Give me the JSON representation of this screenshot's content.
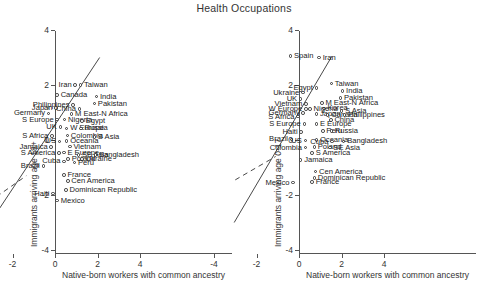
{
  "figure": {
    "title": "Health Occupations",
    "xlabel": "Native-born workers with common ancestry",
    "xticks": [
      "-4",
      "-2",
      "0",
      "2",
      "4"
    ],
    "yticks": [
      "4",
      "2",
      "0",
      "-2",
      "-4"
    ]
  },
  "chart_data": {
    "type": "scatter",
    "title": "Health Occupations",
    "xlabel": "Native-born workers with common ancestry",
    "xlim": [
      -5,
      5
    ],
    "ylim": [
      -5,
      5
    ],
    "grid": false,
    "legend": null,
    "panels": [
      {
        "name": "left",
        "ylabel": "Immigrants arriving age 18+",
        "fit_line_solid": {
          "x": [
            -3.05,
            2.1
          ],
          "y": [
            -3.0,
            3.0
          ]
        },
        "fit_line_dashed": {
          "x": [
            -3.1,
            -1.35
          ],
          "y": [
            -2.25,
            -1.3
          ]
        },
        "points": [
          {
            "label": "Iran",
            "x": 0.95,
            "y": 2.0,
            "side": "r"
          },
          {
            "label": "Taiwan",
            "x": 1.2,
            "y": 2.0,
            "side": "l"
          },
          {
            "label": "Canada",
            "x": 0.1,
            "y": 1.63,
            "side": "l"
          },
          {
            "label": "India",
            "x": 1.95,
            "y": 1.58,
            "side": "l"
          },
          {
            "label": "Pakistan",
            "x": 1.85,
            "y": 1.32,
            "side": "l"
          },
          {
            "label": "Philippines",
            "x": 0.85,
            "y": 1.27,
            "side": "r"
          },
          {
            "label": "Japan",
            "x": 0.05,
            "y": 1.16,
            "side": "r"
          },
          {
            "label": "China",
            "x": 1.15,
            "y": 1.12,
            "side": "r"
          },
          {
            "label": "Germany",
            "x": -0.3,
            "y": 0.97,
            "side": "r"
          },
          {
            "label": "M East-N Africa",
            "x": 0.78,
            "y": 0.95,
            "side": "l"
          },
          {
            "label": "S Europe",
            "x": 0.1,
            "y": 0.74,
            "side": "r"
          },
          {
            "label": "Nigeria",
            "x": 0.45,
            "y": 0.74,
            "side": "l"
          },
          {
            "label": "Egypt",
            "x": 1.28,
            "y": 0.7,
            "side": "l"
          },
          {
            "label": "UK",
            "x": 0.25,
            "y": 0.47,
            "side": "r"
          },
          {
            "label": "W Europe",
            "x": 0.55,
            "y": 0.42,
            "side": "l"
          },
          {
            "label": "Russia",
            "x": 1.22,
            "y": 0.42,
            "side": "l"
          },
          {
            "label": "S Africa",
            "x": -0.15,
            "y": 0.15,
            "side": "r"
          },
          {
            "label": "Colombia",
            "x": 0.58,
            "y": 0.16,
            "side": "l"
          },
          {
            "label": "S Asia",
            "x": 1.85,
            "y": 0.1,
            "side": "l"
          },
          {
            "label": "US",
            "x": 0.22,
            "y": -0.05,
            "side": "r"
          },
          {
            "label": "Oceania",
            "x": 0.55,
            "y": -0.03,
            "side": "l"
          },
          {
            "label": "Jamaica",
            "x": -0.18,
            "y": -0.26,
            "side": "r"
          },
          {
            "label": "Vietnam",
            "x": 0.7,
            "y": -0.24,
            "side": "l"
          },
          {
            "label": "S America",
            "x": 0.18,
            "y": -0.48,
            "side": "r"
          },
          {
            "label": "E Europe",
            "x": 0.42,
            "y": -0.46,
            "side": "l"
          },
          {
            "label": "SE Asia",
            "x": 1.1,
            "y": -0.55,
            "side": "l"
          },
          {
            "label": "Bangladesh",
            "x": 1.9,
            "y": -0.55,
            "side": "l"
          },
          {
            "label": "Poland",
            "x": 0.62,
            "y": -0.7,
            "side": "l"
          },
          {
            "label": "Ukraine",
            "x": 1.28,
            "y": -0.7,
            "side": "l"
          },
          {
            "label": "Cuba",
            "x": 0.42,
            "y": -0.78,
            "side": "r"
          },
          {
            "label": "Peru",
            "x": 0.92,
            "y": -0.82,
            "side": "l"
          },
          {
            "label": "Brazil",
            "x": -0.55,
            "y": -0.95,
            "side": "r"
          },
          {
            "label": "France",
            "x": 0.42,
            "y": -1.28,
            "side": "l"
          },
          {
            "label": "Cen America",
            "x": 0.6,
            "y": -1.5,
            "side": "l"
          },
          {
            "label": "Dominican Republic",
            "x": 0.52,
            "y": -1.82,
            "side": "l"
          },
          {
            "label": "Haiti",
            "x": -0.1,
            "y": -1.95,
            "side": "r"
          },
          {
            "label": "Mexico",
            "x": 0.1,
            "y": -2.2,
            "side": "l"
          }
        ]
      },
      {
        "name": "right",
        "ylabel": "Immigrants arriving age 0-17",
        "fit_line_solid": {
          "x": [
            -3.05,
            1.55
          ],
          "y": [
            -3.0,
            3.05
          ]
        },
        "fit_line_dashed": {
          "x": [
            -3.0,
            -1.1
          ],
          "y": [
            -1.45,
            -0.6
          ]
        },
        "points": [
          {
            "label": "Spain",
            "x": -0.4,
            "y": 3.05,
            "side": "l"
          },
          {
            "label": "Iran",
            "x": 0.95,
            "y": 3.0,
            "side": "l"
          },
          {
            "label": "Taiwan",
            "x": 1.52,
            "y": 2.05,
            "side": "l"
          },
          {
            "label": "Egypt",
            "x": 0.82,
            "y": 1.9,
            "side": "r"
          },
          {
            "label": "India",
            "x": 2.05,
            "y": 1.78,
            "side": "l"
          },
          {
            "label": "Ukraine",
            "x": 0.18,
            "y": 1.72,
            "side": "r"
          },
          {
            "label": "Pakistan",
            "x": 1.95,
            "y": 1.52,
            "side": "l"
          },
          {
            "label": "UK",
            "x": 0.08,
            "y": 1.5,
            "side": "r"
          },
          {
            "label": "M East-N Africa",
            "x": 1.08,
            "y": 1.35,
            "side": "l"
          },
          {
            "label": "Vietnam",
            "x": 0.32,
            "y": 1.3,
            "side": "r"
          },
          {
            "label": "W Europe",
            "x": 0.32,
            "y": 1.12,
            "side": "r"
          },
          {
            "label": "Korea",
            "x": 1.18,
            "y": 1.15,
            "side": "l"
          },
          {
            "label": "Nigeria",
            "x": 0.52,
            "y": 1.12,
            "side": "l"
          },
          {
            "label": "S Asia",
            "x": 2.0,
            "y": 1.05,
            "side": "l"
          },
          {
            "label": "Germany",
            "x": 0.2,
            "y": 0.98,
            "side": "r"
          },
          {
            "label": "Japan",
            "x": 0.82,
            "y": 0.95,
            "side": "l"
          },
          {
            "label": "Canada",
            "x": 1.35,
            "y": 0.9,
            "side": "l"
          },
          {
            "label": "Philippines",
            "x": 2.15,
            "y": 0.9,
            "side": "l"
          },
          {
            "label": "S Africa",
            "x": -0.05,
            "y": 0.85,
            "side": "r"
          },
          {
            "label": "China",
            "x": 1.5,
            "y": 0.72,
            "side": "l"
          },
          {
            "label": "S Europe",
            "x": 0.25,
            "y": 0.58,
            "side": "r"
          },
          {
            "label": "E Europe",
            "x": 0.82,
            "y": 0.58,
            "side": "l"
          },
          {
            "label": "Peru",
            "x": 1.12,
            "y": 0.32,
            "side": "l"
          },
          {
            "label": "Haiti",
            "x": 0.1,
            "y": 0.3,
            "side": "r"
          },
          {
            "label": "Russia",
            "x": 1.52,
            "y": 0.32,
            "side": "l"
          },
          {
            "label": "Brazil",
            "x": -0.35,
            "y": 0.02,
            "side": "r"
          },
          {
            "label": "Oceania",
            "x": 0.82,
            "y": 0.0,
            "side": "l"
          },
          {
            "label": "US",
            "x": 0.3,
            "y": -0.02,
            "side": "r"
          },
          {
            "label": "Cuba",
            "x": 1.55,
            "y": -0.06,
            "side": "r"
          },
          {
            "label": "Bangladesh",
            "x": 2.1,
            "y": -0.05,
            "side": "l"
          },
          {
            "label": "Colombia",
            "x": 0.3,
            "y": -0.28,
            "side": "r"
          },
          {
            "label": "Poland",
            "x": 0.72,
            "y": -0.26,
            "side": "l"
          },
          {
            "label": "SE Asia",
            "x": 1.45,
            "y": -0.28,
            "side": "l"
          },
          {
            "label": "S America",
            "x": 0.62,
            "y": -0.48,
            "side": "l"
          },
          {
            "label": "Jamaica",
            "x": 0.08,
            "y": -0.72,
            "side": "l"
          },
          {
            "label": "Cen America",
            "x": 0.78,
            "y": -1.15,
            "side": "l"
          },
          {
            "label": "Dominican Republic",
            "x": 0.72,
            "y": -1.38,
            "side": "l"
          },
          {
            "label": "France",
            "x": 0.62,
            "y": -1.52,
            "side": "l"
          },
          {
            "label": "Mexico",
            "x": -0.28,
            "y": -1.55,
            "side": "r"
          }
        ]
      }
    ]
  }
}
